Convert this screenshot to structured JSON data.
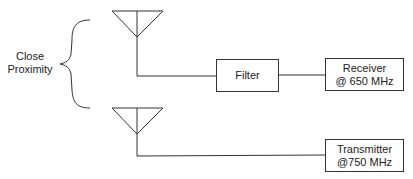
{
  "diagram": {
    "bracket_label": [
      "Close",
      "Proximity"
    ],
    "filter": {
      "label": "Filter"
    },
    "receiver": {
      "line1": "Receiver",
      "line2": "@ 650 MHz"
    },
    "transmitter": {
      "line1": "Transmitter",
      "line2": "@750 MHz"
    },
    "line_color": "#333333"
  }
}
